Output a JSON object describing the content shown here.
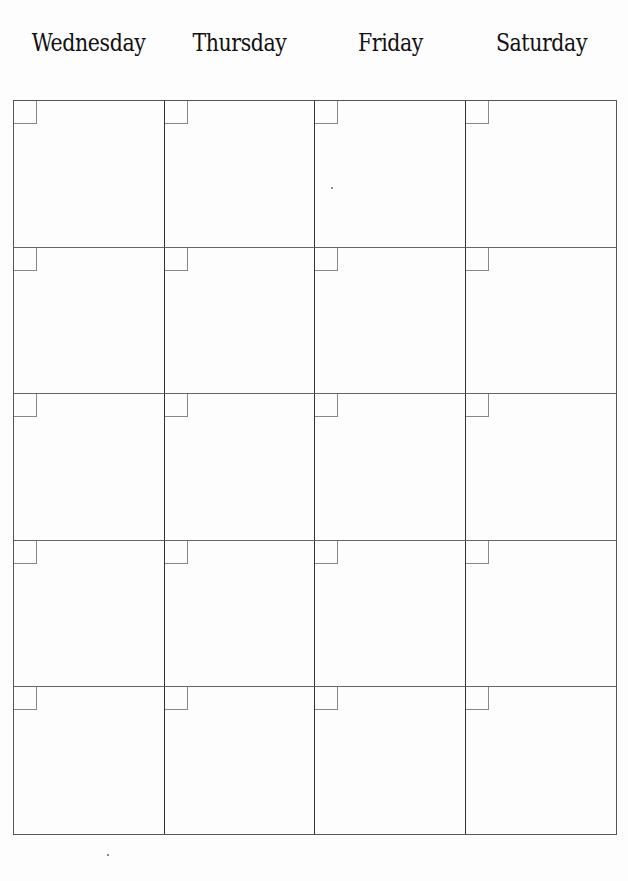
{
  "calendar": {
    "days": [
      "Wednesday",
      "Thursday",
      "Friday",
      "Saturday"
    ],
    "rows": 5,
    "columns": 4,
    "line_color": "#333333",
    "background": "#fdfdfd"
  }
}
